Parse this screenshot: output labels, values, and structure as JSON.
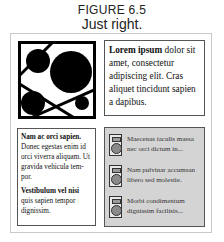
{
  "figure": {
    "label": "FIGURE 6.5",
    "caption": "Just right."
  },
  "lorem_box": {
    "bold": "Lorem ipsum",
    "text": " dolor sit amet, consectetur adipiscing elit. Cras aliquet tincidunt sapien a dapibus."
  },
  "left_box": {
    "p1_bold": "Nam ac orci sapien.",
    "p1_text": " Donec egestas enim id orci viverra aliquam. Ut gravida vehicula tem-por.",
    "p2_bold": "Vestibulum vel nisi",
    "p2_text": " quis sapien tempor dignissim."
  },
  "gray_box": {
    "background": "#d4d4d4",
    "items": [
      {
        "icon": "device-icon",
        "text": "Maecenas iaculis massa nec  orci dictum in..."
      },
      {
        "icon": "device-icon",
        "text": "Nam pulvinar accumsan libero sed molestie."
      },
      {
        "icon": "device-icon",
        "text": "Morbi condimentum dignissim facilisis..."
      }
    ]
  }
}
